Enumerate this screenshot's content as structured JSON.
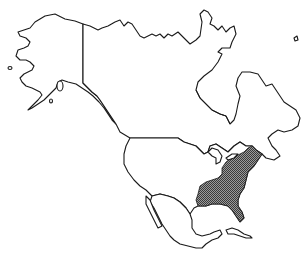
{
  "map": {
    "title": "",
    "region": "North America",
    "regions": [
      {
        "name": "Alaska",
        "highlighted": false
      },
      {
        "name": "Canada",
        "highlighted": false
      },
      {
        "name": "Greenland",
        "highlighted": false
      },
      {
        "name": "United States",
        "highlighted": false
      },
      {
        "name": "Eastern United States",
        "highlighted": true
      },
      {
        "name": "Mexico",
        "highlighted": false
      },
      {
        "name": "Cuba",
        "highlighted": false
      }
    ],
    "colors": {
      "outline": "#1a1a1a",
      "land": "#ffffff",
      "highlight_fill": "#6e6e6e",
      "background": "#ffffff"
    }
  }
}
